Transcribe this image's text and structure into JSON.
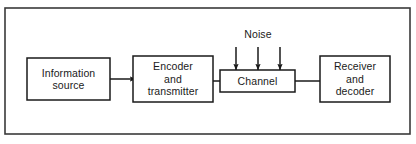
{
  "diagram": {
    "frame": {
      "name": "outer-frame",
      "x": 5,
      "y": 8,
      "width": 405,
      "height": 126,
      "stroke": "#3a3a3a",
      "stroke_width": 1.6,
      "fill": "#ffffff"
    },
    "colors": {
      "stroke": "#1a1a1a",
      "frame_stroke": "#3a3a3a",
      "text": "#1a1a1a",
      "background": "#ffffff"
    },
    "blocks": [
      {
        "id": "information-source",
        "name": "block-information-source",
        "lines": [
          "Information",
          "source"
        ],
        "x": 27,
        "y": 58,
        "width": 83,
        "height": 42
      },
      {
        "id": "encoder-and-transmitter",
        "name": "block-encoder-and-transmitter",
        "lines": [
          "Encoder",
          "and",
          "transmitter"
        ],
        "x": 133,
        "y": 56,
        "width": 80,
        "height": 46
      },
      {
        "id": "channel",
        "name": "block-channel",
        "lines": [
          "Channel"
        ],
        "x": 220,
        "y": 70,
        "width": 75,
        "height": 22
      },
      {
        "id": "receiver-and-decoder",
        "name": "block-receiver-and-decoder",
        "lines": [
          "Receiver",
          "and",
          "decoder"
        ],
        "x": 320,
        "y": 56,
        "width": 70,
        "height": 46
      }
    ],
    "annotations": [
      {
        "id": "noise",
        "name": "label-noise",
        "text": "Noise",
        "x": 258,
        "y": 34
      }
    ],
    "flow_arrows": [
      {
        "id": "source-to-encoder",
        "name": "arrow-source-to-encoder",
        "from": "information-source",
        "to": "encoder-and-transmitter",
        "x1": 110,
        "y1": 79,
        "x2": 136,
        "y2": 79
      },
      {
        "id": "encoder-to-channel",
        "name": "arrow-encoder-to-channel",
        "from": "encoder-and-transmitter",
        "to": "channel",
        "x1": 213,
        "y1": 81,
        "x2": 240,
        "y2": 81
      },
      {
        "id": "channel-to-receiver",
        "name": "arrow-channel-to-receiver",
        "from": "channel",
        "to": "receiver-and-decoder",
        "x1": 295,
        "y1": 81,
        "x2": 341,
        "y2": 81
      }
    ],
    "noise_arrows": [
      {
        "id": "noise-arrow-1",
        "name": "arrow-noise-left",
        "x": 236,
        "y1": 47,
        "y2": 70
      },
      {
        "id": "noise-arrow-2",
        "name": "arrow-noise-middle",
        "x": 258,
        "y1": 47,
        "y2": 70
      },
      {
        "id": "noise-arrow-3",
        "name": "arrow-noise-right",
        "x": 280,
        "y1": 47,
        "y2": 70
      }
    ]
  }
}
